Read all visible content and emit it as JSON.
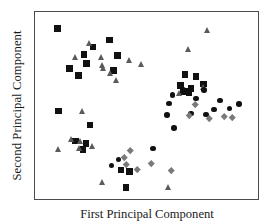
{
  "figure": {
    "ylabel": "Second Principal Component",
    "xlabel": "First Principal Component"
  },
  "chart_data": {
    "type": "scatter",
    "title": "",
    "xlabel": "First Principal Component",
    "ylabel": "Second Principal Component",
    "grid": false,
    "legend": null,
    "axis_ticks": {
      "x": [],
      "y": []
    },
    "xlim": [
      0,
      1
    ],
    "ylim": [
      0,
      1
    ],
    "marker_styles": {
      "square": {
        "shape": "square",
        "color": "#111111",
        "size_px": 6.5
      },
      "circle": {
        "shape": "circle",
        "color": "#111111",
        "size_px": 5.5
      },
      "triangle": {
        "shape": "triangle-up",
        "color": "#5b5b5b",
        "size_px": 6
      },
      "diamond": {
        "shape": "diamond",
        "color": "#7a7a7a",
        "size_px": 4.5
      }
    },
    "series": [
      {
        "name": "square",
        "marker": "square",
        "color": "#111111",
        "points": [
          [
            0.102,
            0.912
          ],
          [
            0.333,
            0.849
          ],
          [
            0.26,
            0.812
          ],
          [
            0.219,
            0.772
          ],
          [
            0.37,
            0.767
          ],
          [
            0.232,
            0.724
          ],
          [
            0.155,
            0.699
          ],
          [
            0.352,
            0.687
          ],
          [
            0.196,
            0.661
          ],
          [
            0.106,
            0.47
          ],
          [
            0.247,
            0.395
          ],
          [
            0.182,
            0.311
          ],
          [
            0.228,
            0.296
          ],
          [
            0.216,
            0.264
          ],
          [
            0.672,
            0.665
          ],
          [
            0.723,
            0.654
          ],
          [
            0.755,
            0.614
          ],
          [
            0.653,
            0.607
          ],
          [
            0.7,
            0.59
          ],
          [
            0.672,
            0.578
          ],
          [
            0.663,
            0.572
          ],
          [
            0.69,
            0.567
          ],
          [
            0.385,
            0.155
          ],
          [
            0.424,
            0.146
          ],
          [
            0.408,
            0.062
          ]
        ]
      },
      {
        "name": "triangle",
        "marker": "triangle",
        "color": "#5b5b5b",
        "points": [
          [
            0.243,
            0.836
          ],
          [
            0.178,
            0.762
          ],
          [
            0.294,
            0.757
          ],
          [
            0.42,
            0.742
          ],
          [
            0.474,
            0.721
          ],
          [
            0.3,
            0.716
          ],
          [
            0.307,
            0.7
          ],
          [
            0.335,
            0.672
          ],
          [
            0.363,
            0.636
          ],
          [
            0.772,
            0.903
          ],
          [
            0.685,
            0.802
          ],
          [
            0.646,
            0.565
          ],
          [
            0.755,
            0.598
          ],
          [
            0.213,
            0.47
          ],
          [
            0.104,
            0.266
          ],
          [
            0.162,
            0.32
          ],
          [
            0.204,
            0.312
          ],
          [
            0.196,
            0.272
          ],
          [
            0.257,
            0.285
          ],
          [
            0.3,
            0.089
          ],
          [
            0.596,
            0.063
          ]
        ]
      },
      {
        "name": "circle",
        "marker": "circle",
        "color": "#111111",
        "points": [
          [
            0.664,
            0.584
          ],
          [
            0.617,
            0.555
          ],
          [
            0.758,
            0.582
          ],
          [
            0.722,
            0.538
          ],
          [
            0.83,
            0.527
          ],
          [
            0.802,
            0.479
          ],
          [
            0.873,
            0.483
          ],
          [
            0.914,
            0.508
          ],
          [
            0.7,
            0.458
          ],
          [
            0.766,
            0.452
          ],
          [
            0.6,
            0.512
          ],
          [
            0.592,
            0.448
          ],
          [
            0.624,
            0.38
          ],
          [
            0.529,
            0.27
          ],
          [
            0.375,
            0.212
          ],
          [
            0.342,
            0.178
          ]
        ]
      },
      {
        "name": "diamond",
        "marker": "diamond",
        "color": "#7a7a7a",
        "points": [
          [
            0.718,
            0.505
          ],
          [
            0.69,
            0.448
          ],
          [
            0.848,
            0.44
          ],
          [
            0.884,
            0.438
          ],
          [
            0.78,
            0.434
          ],
          [
            0.425,
            0.26
          ],
          [
            0.399,
            0.225
          ],
          [
            0.411,
            0.187
          ],
          [
            0.52,
            0.192
          ],
          [
            0.46,
            0.158
          ],
          [
            0.611,
            0.152
          ]
        ]
      }
    ]
  }
}
